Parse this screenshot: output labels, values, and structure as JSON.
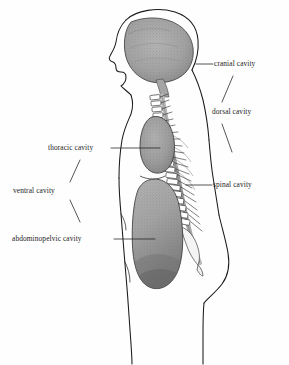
{
  "figure": {
    "background": "#fefefe",
    "ink": "#1a1a1a",
    "fill_gray": "#a0a0a0",
    "fill_gray_dark": "#8b8b8b",
    "cord_gray": "#9a9a9a"
  },
  "labels": {
    "cranial": "cranial cavity",
    "dorsal": "dorsal cavity",
    "spinal": "spinal cavity",
    "thoracic": "thoracic cavity",
    "ventral": "ventral cavity",
    "abdominopelvic": "abdominopelvic cavity"
  },
  "structures": {
    "brain": "brain-mass",
    "skull": "skull-outline",
    "face": "face-profile",
    "vertebral_column": "vertebral-column",
    "spinal_cord": "spinal-cord",
    "thoracic_mass": "thoracic-cavity-mass",
    "abdominal_mass": "abdominopelvic-cavity-mass",
    "body": "body-outline"
  }
}
